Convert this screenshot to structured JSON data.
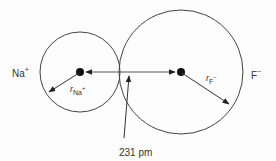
{
  "diagram": {
    "ions": [
      {
        "name": "Na",
        "charge": "+",
        "radius_label": "r",
        "radius_sub": "Na",
        "radius_sup": "+"
      },
      {
        "name": "F",
        "charge": "−",
        "radius_label": "r",
        "radius_sub": "F",
        "radius_sup": "−"
      }
    ],
    "distance_label": "231 pm",
    "colors": {
      "line": "#333333",
      "background": "#fdfdfd"
    }
  }
}
